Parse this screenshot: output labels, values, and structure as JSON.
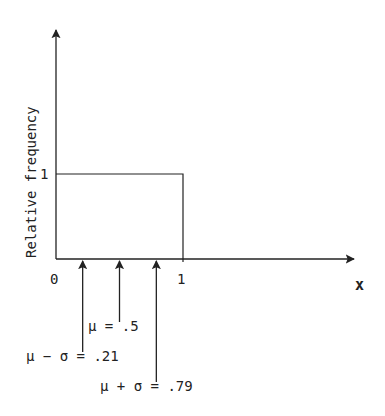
{
  "figure": {
    "type": "uniform-distribution-diagram",
    "y_axis_label": "Relative frequency",
    "x_axis_label": "x",
    "y_tick_label": "1",
    "x_tick_labels": [
      "0",
      "1"
    ],
    "density": {
      "x_min": 0,
      "x_max": 1,
      "height": 1
    },
    "markers": [
      {
        "name": "mu-minus-sigma",
        "value": 0.21,
        "label": "μ − σ = .21"
      },
      {
        "name": "mu",
        "value": 0.5,
        "label": "μ = .5"
      },
      {
        "name": "mu-plus-sigma",
        "value": 0.79,
        "label": "μ + σ = .79"
      }
    ]
  },
  "colors": {
    "ink": "#222222",
    "background": "#ffffff"
  }
}
